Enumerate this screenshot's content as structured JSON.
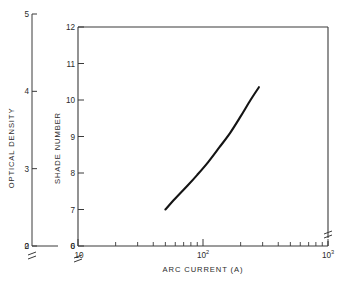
{
  "chart_data": {
    "type": "line",
    "title": "",
    "xlabel": "ARC CURRENT  (A)",
    "ylabel_left": "OPTICAL DENSITY",
    "ylabel_right": "SHADE NUMBER",
    "xscale": "log",
    "xlim": [
      10,
      1000
    ],
    "xticks_major": [
      10,
      100,
      1000
    ],
    "xticklabels": [
      "10",
      "10",
      "10"
    ],
    "xtick_exponents": [
      "",
      "2",
      "3"
    ],
    "xticks_minor": [
      20,
      30,
      40,
      50,
      60,
      70,
      80,
      90,
      200,
      300,
      400,
      500,
      600,
      700,
      800,
      900
    ],
    "ylim_left": [
      2,
      5
    ],
    "yticks_left": [
      2,
      3,
      4,
      5
    ],
    "yticklabels_left": [
      "2",
      "3",
      "4",
      "5"
    ],
    "ylim_right": [
      6,
      12
    ],
    "yticks_right": [
      6,
      7,
      8,
      9,
      10,
      11,
      12
    ],
    "yticklabels_right": [
      "6",
      "7",
      "8",
      "9",
      "10",
      "11",
      "12"
    ],
    "axis_break": true,
    "axis_break_label": "0",
    "grid": false,
    "legend": false,
    "series": [
      {
        "name": "shade number vs arc current",
        "x": [
          50,
          60,
          75,
          90,
          110,
          135,
          165,
          200,
          240,
          280
        ],
        "y": [
          7.0,
          7.3,
          7.65,
          7.95,
          8.3,
          8.7,
          9.1,
          9.55,
          10.0,
          10.35
        ]
      }
    ]
  },
  "labels": {
    "x_axis_title": "ARC CURRENT  (A)",
    "y_axis_left_title": "OPTICAL DENSITY",
    "y_axis_right_title": "SHADE NUMBER",
    "zero_left": "0",
    "zero_right": "0",
    "x_first_label": "10"
  },
  "colors": {
    "curve": "#141414",
    "axis": "#3a3a3a",
    "background": "#ffffff",
    "text": "#2b2b2b"
  }
}
